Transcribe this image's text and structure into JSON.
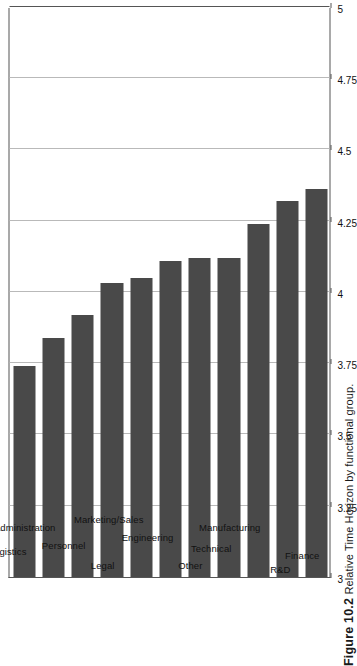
{
  "figure": {
    "number": "Figure 10.2",
    "caption": "Relative Time Horizon by functional group."
  },
  "chart_data": {
    "type": "bar",
    "orientation": "vertical-rotated-90",
    "title": "Relative Time Horizon by functional group.",
    "xlabel": "",
    "ylabel": "",
    "ylim": [
      3,
      5
    ],
    "yticks": [
      3,
      3.25,
      3.5,
      3.75,
      4,
      4.25,
      4.5,
      4.75,
      5
    ],
    "ytick_labels": [
      "3",
      "3.25",
      "3.5",
      "3.75",
      "4",
      "4.25",
      "4.5",
      "4.75",
      "5"
    ],
    "grid": true,
    "legend": null,
    "bar_color": "#494949",
    "categories": [
      "Logistics",
      "Administration",
      "Personnel",
      "Legal",
      "Marketing/Sales",
      "Engineering",
      "Other",
      "Technical",
      "Manufacturing",
      "R&D",
      "Finance"
    ],
    "values": [
      3.74,
      3.84,
      3.92,
      4.03,
      4.05,
      4.11,
      4.12,
      4.12,
      4.24,
      4.32,
      4.36
    ]
  }
}
